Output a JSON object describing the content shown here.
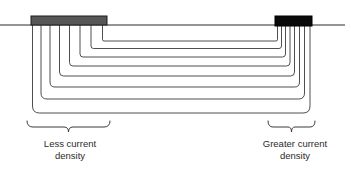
{
  "figure": {
    "name": "current-density-distribution-diagram",
    "width": 351,
    "height": 169,
    "background_color": "#ffffff"
  },
  "colors": {
    "flux_line": "#3b3b3b",
    "baseline": "#2a2a2a",
    "anode_left_fill": "#575757",
    "anode_left_stroke": "#1d1d1d",
    "anode_right_fill": "#0a0a0a",
    "anode_right_stroke": "#000000",
    "brace": "#3b3b3b",
    "text": "#2b2b2b"
  },
  "electrodes": {
    "left": {
      "label": "wide-electrode",
      "x": 31,
      "y": 16,
      "width": 76,
      "height": 9,
      "fill": "#575757"
    },
    "right": {
      "label": "narrow-electrode",
      "x": 275,
      "y": 16,
      "width": 37,
      "height": 10,
      "fill": "#0a0a0a"
    }
  },
  "baseline": {
    "label": "workpiece-surface-line",
    "x1": 0,
    "x2": 345,
    "y": 25
  },
  "flux": {
    "count": 8,
    "description": "nested u-shaped current flux lines",
    "left_x": [
      32.5,
      41,
      50,
      59.5,
      69.5,
      80,
      91,
      102.5
    ],
    "right_x": [
      277.5,
      281.5,
      285.5,
      290,
      294.5,
      299.5,
      304.5,
      310
    ],
    "bottom_y": [
      41,
      48.5,
      57,
      66,
      76,
      87,
      99,
      113
    ],
    "corner_radius": [
      7,
      8,
      9,
      10,
      11,
      12,
      13,
      14
    ],
    "top_y": 25
  },
  "braces": {
    "left": {
      "x_start": 27,
      "x_end": 110,
      "y_top": 121,
      "y_tip": 132,
      "span_label": "less-current-density-span"
    },
    "right": {
      "x_start": 268,
      "x_end": 315,
      "y_top": 121,
      "y_tip": 132,
      "span_label": "greater-current-density-span"
    }
  },
  "captions": {
    "left": {
      "line1": "Less current",
      "line2": "density"
    },
    "right": {
      "line1": "Greater current",
      "line2": "density"
    }
  }
}
